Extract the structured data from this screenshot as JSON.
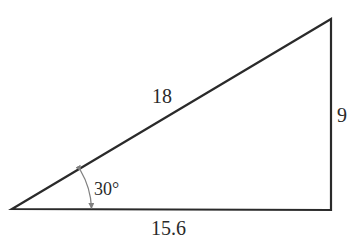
{
  "diagram": {
    "type": "right-triangle",
    "labels": {
      "hypotenuse": "18",
      "vertical_side": "9",
      "base": "15.6",
      "angle": "30°"
    },
    "colors": {
      "stroke": "#2a2a2a",
      "angle_marker": "#808080",
      "background": "#ffffff"
    }
  }
}
